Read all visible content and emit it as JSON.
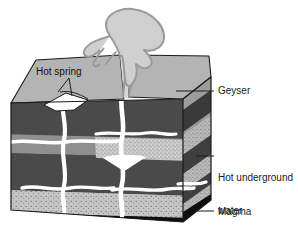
{
  "diagram": {
    "type": "block-diagram",
    "labels": {
      "hot_spring": "Hot spring",
      "geyser": "Geyser",
      "hot_underground_water_line1": "Hot underground",
      "hot_underground_water_line2": "water",
      "magma": "Magma"
    },
    "colors": {
      "background": "#ffffff",
      "outline": "#1a1a1a",
      "top_surface": "#b4b4b4",
      "layer_dark": "#4a4a4a",
      "layer_medium": "#8f8f8f",
      "layer_light_speckled": "#c9c9c9",
      "magma": "#0d0d0d",
      "water_channel": "#ffffff",
      "plume": "#b9b9b9",
      "side_face_shadow": "#3a3a3a",
      "text": "#1a1a1a"
    },
    "layers": [
      {
        "name": "surface",
        "fill": "#b4b4b4"
      },
      {
        "name": "upper-rock",
        "fill": "#4a4a4a"
      },
      {
        "name": "aquifer-band",
        "fill": "#8f8f8f"
      },
      {
        "name": "porous-sediment",
        "fill": "#c9c9c9"
      },
      {
        "name": "lower-rock",
        "fill": "#4a4a4a"
      },
      {
        "name": "deep-sediment",
        "fill": "#c9c9c9"
      },
      {
        "name": "magma",
        "fill": "#0d0d0d"
      }
    ],
    "features": [
      {
        "name": "geyser-plume",
        "description": "erupting steam column above the surface"
      },
      {
        "name": "geyser-conduit",
        "description": "vertical white channel feeding the geyser"
      },
      {
        "name": "hot-spring-pool",
        "description": "white pool on the top surface"
      },
      {
        "name": "hot-spring-conduit",
        "description": "vertical white channel feeding the hot spring"
      },
      {
        "name": "water-channels",
        "description": "horizontal white underground water veins"
      }
    ]
  }
}
